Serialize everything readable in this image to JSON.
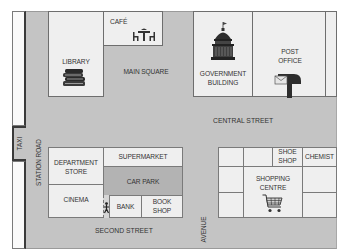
{
  "map": {
    "buildings": {
      "library": "LIBRARY",
      "cafe": "CAFÉ",
      "government_building": [
        "GOVERNMENT",
        "BUILDING"
      ],
      "post_office": [
        "POST",
        "OFFICE"
      ],
      "department_store": [
        "DEPARTMENT",
        "STORE"
      ],
      "supermarket": "SUPERMARKET",
      "car_park": "CAR PARK",
      "cinema": "CINEMA",
      "bank": "BANK",
      "book_shop": [
        "BOOK",
        "SHOP"
      ],
      "shoe_shop": [
        "SHOE",
        "SHOP"
      ],
      "chemist": "CHEMIST",
      "shopping_centre": [
        "SHOPPING",
        "CENTRE"
      ]
    },
    "areas": {
      "main_square": "MAIN SQUARE",
      "taxi": "TAXI"
    },
    "streets": {
      "central_street": "CENTRAL STREET",
      "station_road": "STATION ROAD",
      "second_street": "SECOND STREET",
      "avenue": "AVENUE"
    },
    "icons": [
      "books-icon",
      "cafe-table-icon",
      "capitol-dome-icon",
      "mailbox-icon",
      "pedestrian-icon",
      "shopping-cart-icon"
    ],
    "colors": {
      "street": "#c4c4c4",
      "building": "#efefef",
      "car_park": "#b3b3b3",
      "outline": "#6e6e6e"
    }
  }
}
